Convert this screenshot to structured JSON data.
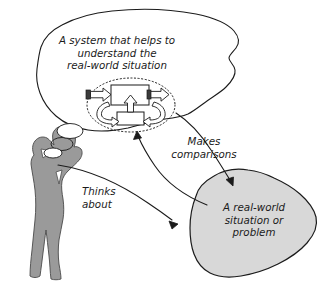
{
  "diagram": {
    "title_alt": "Systems thinking: a person thinks about a real-world situation and builds a system that makes comparisons",
    "canvas": {
      "width": 322,
      "height": 286,
      "background": "#ffffff"
    },
    "colors": {
      "ink": "#1b1b1b",
      "figure_fill": "#9a9a9a",
      "blob_fill": "#d8d8d8",
      "cloud_fill": "#ffffff",
      "box_fill": "#ffffff",
      "valve_fill": "#3b3b3b"
    },
    "nodes": {
      "thought_cloud": {
        "name": "thought-cloud",
        "text": "A system that helps to understand the\nreal-world situation",
        "fill": "#ffffff"
      },
      "real_world_blob": {
        "name": "real-world-blob",
        "text": "A real-world\nsituation or\nproblem",
        "fill": "#d8d8d8"
      },
      "person": {
        "name": "person-figure",
        "fill": "#9a9a9a"
      },
      "system_model": {
        "name": "system-model-icon",
        "boundary": "dotted-ellipse",
        "parts": [
          "input-valve",
          "input-block-arrow",
          "main-process-box",
          "output-block-arrow",
          "output-valve",
          "feedback-box",
          "feedback-up-arrow",
          "feedback-left-curve-arrow",
          "feedback-right-curve-arrow"
        ]
      }
    },
    "connectors": [
      {
        "name": "makes-comparisons-arrow",
        "label": "Makes\ncomparisons",
        "from": "real-world-blob",
        "to": "system-model-icon"
      },
      {
        "name": "cloud-to-blob-arrow",
        "label": "",
        "from": "thought-cloud",
        "to": "real-world-blob"
      },
      {
        "name": "thinks-about-arrow",
        "label": "Thinks\nabout",
        "from": "person-figure",
        "to": "real-world-blob"
      }
    ],
    "labels": {
      "makes_comparisons": "Makes\ncomparisons",
      "thinks_about": "Thinks\nabout"
    }
  }
}
